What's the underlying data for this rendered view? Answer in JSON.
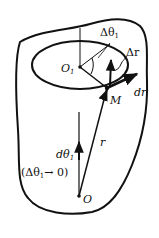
{
  "diagram": {
    "labels": {
      "delta_theta": "Δθ",
      "delta_theta_sub": "1",
      "delta_r": "Δr",
      "dr": "dr",
      "M": "M",
      "O1": "O",
      "O1_sub": "1",
      "d_theta": "dθ",
      "d_theta_sub": "1",
      "r": "r",
      "limit_open": "(Δθ",
      "limit_sub": "1",
      "limit_close": "→ 0)",
      "O": "O"
    },
    "colors": {
      "stroke": "#111111",
      "background": "#ffffff"
    }
  }
}
